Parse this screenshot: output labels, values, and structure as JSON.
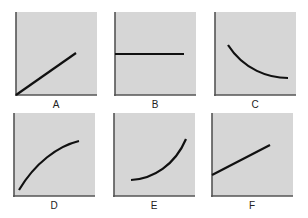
{
  "figure": {
    "colors": {
      "plot_bg": "#d6d6d6",
      "axis": "#555555",
      "curve": "#111111",
      "label": "#222222"
    },
    "panels": [
      {
        "label": "A",
        "shape": "linear-through-origin",
        "path": "M1,83 L61,41"
      },
      {
        "label": "B",
        "shape": "horizontal-constant",
        "path": "M1,42 L70,42"
      },
      {
        "label": "C",
        "shape": "decreasing-convex",
        "path": "M14,33 C30,58 55,66 74,66"
      },
      {
        "label": "D",
        "shape": "increasing-concave",
        "path": "M6,77 C22,50 45,33 66,28"
      },
      {
        "label": "E",
        "shape": "increasing-convex",
        "path": "M18,67 C40,66 62,52 73,26"
      },
      {
        "label": "F",
        "shape": "linear-positive-intercept",
        "path": "M1,62 L59,32"
      }
    ]
  }
}
